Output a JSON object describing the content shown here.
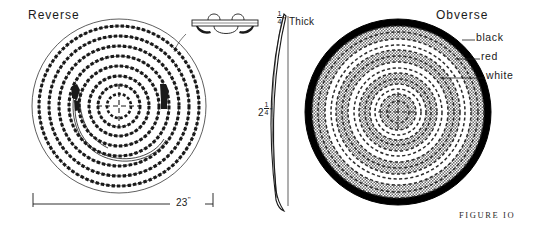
{
  "figure": {
    "caption": "FIGURE IO",
    "reverse_label": "Reverse",
    "obverse_label": "Obverse"
  },
  "callouts": {
    "black": "black",
    "red": "red",
    "white": "white"
  },
  "dimensions": {
    "diameter": "23\"",
    "diameter_value": "23",
    "diameter_unit": "\"",
    "height_whole": "2",
    "height_numerator": "1",
    "height_denominator": "4",
    "height_unit": "\"",
    "thickness_numerator": "1",
    "thickness_denominator": "4",
    "thickness_unit": "\"",
    "thickness_word": "Thick"
  },
  "colors": {
    "ink": "#1a1a1a",
    "rim_black": "#000000",
    "band_gray": "#9a9a9a",
    "band_white": "#ffffff",
    "paper": "#ffffff"
  },
  "obverse_rings": [
    {
      "name": "outer-rim",
      "color": "black",
      "r_outer": 93,
      "r_inner": 86
    },
    {
      "name": "ring-1-gray",
      "color": "red",
      "r_outer": 86,
      "r_inner": 73
    },
    {
      "name": "ring-2-white",
      "color": "white",
      "r_outer": 73,
      "r_inner": 62
    },
    {
      "name": "ring-3-gray",
      "color": "red",
      "r_outer": 62,
      "r_inner": 50
    },
    {
      "name": "ring-4-white",
      "color": "white",
      "r_outer": 50,
      "r_inner": 39
    },
    {
      "name": "ring-5-gray",
      "color": "red",
      "r_outer": 39,
      "r_inner": 28
    },
    {
      "name": "ring-6-white",
      "color": "white",
      "r_outer": 28,
      "r_inner": 18
    },
    {
      "name": "center-gray",
      "color": "red",
      "r_outer": 18,
      "r_inner": 0
    }
  ],
  "reverse_rings": [
    8,
    8
  ]
}
